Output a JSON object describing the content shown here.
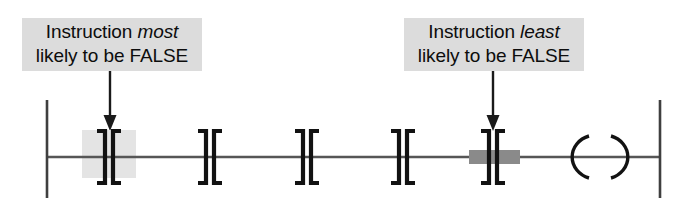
{
  "figure": {
    "background_color": "#ffffff",
    "width": 694,
    "height": 208
  },
  "callouts": [
    {
      "id": "most-likely-false",
      "line1_prefix": "Instruction ",
      "line1_emphasis": "most",
      "line2": "likely to be FALSE",
      "background_color": "#dcdcdc",
      "text_color": "#0d0d0d",
      "points_to": "contact-1"
    },
    {
      "id": "least-likely-false",
      "line1_prefix": "Instruction ",
      "line1_emphasis": "least",
      "line2": "likely to be FALSE",
      "background_color": "#dcdcdc",
      "text_color": "#0d0d0d",
      "points_to": "contact-5"
    }
  ],
  "arrows": [
    {
      "id": "arrow-to-contact-1",
      "target": "contact-1",
      "color": "#1a1a1a"
    },
    {
      "id": "arrow-to-contact-5",
      "target": "contact-5",
      "color": "#1a1a1a"
    }
  ],
  "ladder": {
    "left_rail": {
      "label": "left-power-rail",
      "color": "#3a3a3a"
    },
    "right_rail": {
      "label": "right-power-rail",
      "color": "#3a3a3a"
    },
    "rung_wire": {
      "label": "rung-wire",
      "color": "#4a4a4a"
    },
    "contacts": [
      {
        "id": "contact-1",
        "type": "normally-closed-contact",
        "symbol": "] [",
        "highlight": "light-box",
        "highlight_color": "#e2e2e2"
      },
      {
        "id": "contact-2",
        "type": "normally-closed-contact",
        "symbol": "] [",
        "highlight": "none",
        "highlight_color": ""
      },
      {
        "id": "contact-3",
        "type": "normally-closed-contact",
        "symbol": "] [",
        "highlight": "none",
        "highlight_color": ""
      },
      {
        "id": "contact-4",
        "type": "normally-closed-contact",
        "symbol": "] [",
        "highlight": "none",
        "highlight_color": ""
      },
      {
        "id": "contact-5",
        "type": "normally-closed-contact",
        "symbol": "] [",
        "highlight": "dark-bar",
        "highlight_color": "#808080"
      }
    ],
    "coil": {
      "id": "output-coil",
      "type": "output-coil",
      "symbol": "( )",
      "color": "#1a1a1a"
    }
  }
}
